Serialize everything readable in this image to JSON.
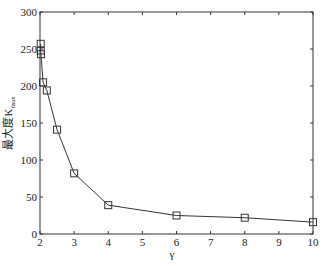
{
  "chart_data": {
    "type": "line",
    "title": "",
    "xlabel": "γ",
    "ylabel": "最大度K",
    "ylabel_subscript": "max",
    "xlim": [
      2,
      10
    ],
    "ylim": [
      0,
      300
    ],
    "xticks": [
      2,
      3,
      4,
      5,
      6,
      7,
      8,
      9,
      10
    ],
    "yticks": [
      0,
      50,
      100,
      150,
      200,
      250,
      300
    ],
    "grid": false,
    "legend": null,
    "series": [
      {
        "name": "K_max",
        "marker": "square",
        "color": "#333333",
        "x": [
          2.02,
          2.02,
          2.03,
          2.09,
          2.2,
          2.5,
          3,
          4,
          6,
          8,
          10
        ],
        "y": [
          257,
          248,
          243,
          205,
          194,
          141,
          82,
          39,
          25,
          22,
          16
        ]
      }
    ]
  }
}
